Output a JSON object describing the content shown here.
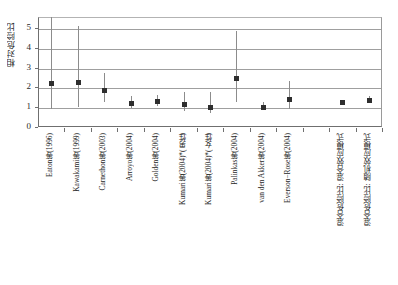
{
  "chart_data": {
    "type": "scatter",
    "title": "",
    "xlabel": "",
    "ylabel": "相对危险比",
    "ylim": [
      0,
      5.55
    ],
    "yticks": [
      0,
      1,
      2,
      3,
      4,
      5
    ],
    "ytick_labels": [
      "0",
      "1",
      "2",
      "3",
      "4",
      "5"
    ],
    "grid": true,
    "legend": "none",
    "error_bar_style": "vertical-line-with-square-marker",
    "categories": [
      "Eaton等(1996)",
      "Kawakami等(1999)",
      "Carnethon等(2003)",
      "Arroyo等(2004)",
      "Golden等(2004)",
      "Kumari等(2004)*(男性)",
      "Kumari等(2004)*(女性)",
      "Palinkas等(2004)",
      "van den Akker等(2004)",
      "Everson−Rose等(2004)",
      "",
      "混合危险比: 混合效应模式",
      "混合危险比: 随机效应模式"
    ],
    "values": [
      2.2,
      2.28,
      1.85,
      1.22,
      1.31,
      1.15,
      1.02,
      2.45,
      1.0,
      1.43,
      null,
      1.26,
      1.35
    ],
    "ci_low": [
      0.92,
      1.0,
      1.25,
      0.95,
      1.05,
      0.82,
      0.72,
      1.26,
      0.86,
      0.9,
      null,
      1.15,
      1.2
    ],
    "ci_high": [
      5.55,
      5.1,
      2.72,
      1.56,
      1.62,
      1.75,
      1.76,
      4.86,
      1.24,
      2.31,
      null,
      1.36,
      1.55
    ],
    "ci_high_truncated": [
      true,
      false,
      false,
      false,
      false,
      false,
      false,
      false,
      false,
      false,
      false,
      false,
      false
    ],
    "series": [
      {
        "name": "相对危险比",
        "values": [
          2.2,
          2.28,
          1.85,
          1.22,
          1.31,
          1.15,
          1.02,
          2.45,
          1.0,
          1.43,
          null,
          1.26,
          1.35
        ]
      }
    ]
  },
  "colors": {
    "marker": "#2e2e2e",
    "error_bar": "#8c8c8c",
    "gridline": "#9f9f9f",
    "axis": "#6f6f6f",
    "text": "#262626",
    "background": "#ffffff"
  }
}
